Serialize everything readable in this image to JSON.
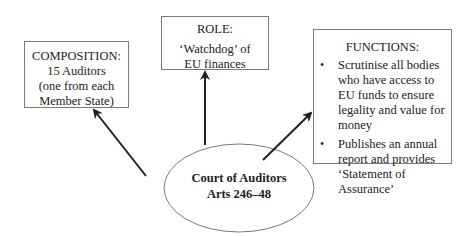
{
  "diagram": {
    "center": {
      "title": "Court of Auditors",
      "subtitle": "Arts 246–48"
    },
    "composition": {
      "title": "COMPOSITION:",
      "lines": [
        "15 Auditors",
        "(one from each",
        "Member State)"
      ]
    },
    "role": {
      "title": "ROLE:",
      "lines": [
        "‘Watchdog’ of",
        "EU finances"
      ]
    },
    "functions": {
      "title": "FUNCTIONS:",
      "bullet_glyph": "•",
      "items": [
        "Scrutinise all bodies who have access to EU funds to ensure legality and value for money",
        "Publishes an annual report and provides ‘Statement of Assurance’"
      ]
    },
    "colors": {
      "box_border": "#7a7a7a",
      "arrow": "#222222",
      "text": "#222222",
      "background": "#ffffff"
    }
  }
}
